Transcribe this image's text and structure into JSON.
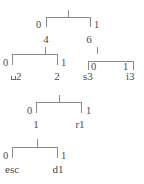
{
  "diagram": {
    "type": "binary-code-tree",
    "title": "",
    "levels": [
      {
        "id": "level-1",
        "parent_tick_label": "",
        "edges": [
          {
            "bit": "0",
            "side": "left"
          },
          {
            "bit": "1",
            "side": "right"
          }
        ],
        "nodes": [
          {
            "label": "4",
            "side": "left"
          },
          {
            "label": "6",
            "side": "right"
          }
        ]
      },
      {
        "id": "level-2-left",
        "edges": [
          {
            "bit": "0",
            "side": "left"
          },
          {
            "bit": "1",
            "side": "right"
          }
        ],
        "nodes": [
          {
            "label": "2",
            "prefix_glyph": "blank-space-symbol",
            "side": "left"
          },
          {
            "label": "2",
            "side": "right"
          }
        ]
      },
      {
        "id": "level-2-right",
        "edges": [
          {
            "bit": "0",
            "side": "left"
          },
          {
            "bit": "1",
            "side": "right"
          }
        ],
        "nodes": [
          {
            "label": "s3",
            "side": "left"
          },
          {
            "label": "i3",
            "side": "right"
          }
        ]
      },
      {
        "id": "level-3",
        "edges": [
          {
            "bit": "0",
            "side": "left"
          },
          {
            "bit": "1",
            "side": "right"
          }
        ],
        "nodes": [
          {
            "label": "1",
            "side": "left"
          },
          {
            "label": "r1",
            "side": "right"
          }
        ]
      },
      {
        "id": "level-4",
        "edges": [
          {
            "bit": "0",
            "side": "left"
          },
          {
            "bit": "1",
            "side": "right"
          }
        ],
        "nodes": [
          {
            "label": "esc",
            "side": "left"
          },
          {
            "label": "d1",
            "side": "right"
          }
        ]
      }
    ],
    "colors": {
      "stroke": "#8a8a8a",
      "text": "#4a4a4a",
      "background": "#ffffff"
    }
  }
}
